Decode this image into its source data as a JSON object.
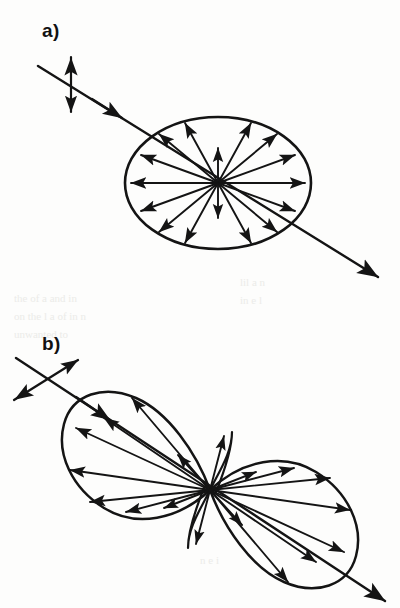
{
  "figure": {
    "background_color": "#fdfdfc",
    "ink_color": "#141414",
    "bleed_color": "#e9e9e6",
    "width": 400,
    "height": 608
  },
  "panels": [
    {
      "id": "a",
      "label": "a)",
      "label_pos": {
        "x": 42,
        "y": 37
      },
      "description": "Incident beam linearly polarized perpendicular to the scattering plane; scattered intensity pattern is circular (isotropic in plane).",
      "pattern_type": "circular",
      "beam": {
        "name": "incident-beam",
        "start": {
          "x": 38,
          "y": 66
        },
        "end": {
          "x": 378,
          "y": 277
        },
        "arrow_at": "end",
        "mid_arrow_at": {
          "x": 118,
          "y": 116
        }
      },
      "polarization_marker": {
        "name": "polarization-double-arrow-vertical",
        "style": "double-headed",
        "x1": 71,
        "y1": 54,
        "x2": 71,
        "y2": 115
      },
      "envelope": {
        "name": "scattering-envelope-ellipse",
        "cx": 218,
        "cy": 183,
        "rx": 93,
        "ry": 66
      },
      "center": {
        "x": 218,
        "y": 183
      },
      "radial_arrows_deg": [
        0,
        24,
        48,
        66,
        90,
        114,
        132,
        156,
        180,
        204,
        228,
        246,
        270,
        294,
        312,
        336
      ],
      "short_arrow_deg": [
        90,
        270
      ],
      "arrow_count": 16
    },
    {
      "id": "b",
      "label": "b)",
      "label_pos": {
        "x": 42,
        "y": 350
      },
      "description": "Incident beam linearly polarized in the scattering plane; scattered intensity follows a two-lobed dipole pattern with a null along the polarization direction.",
      "pattern_type": "dipole-two-lobe",
      "beam": {
        "name": "incident-beam",
        "start": {
          "x": 16,
          "y": 358
        },
        "end": {
          "x": 385,
          "y": 602
        },
        "arrow_at": "end",
        "mid_arrow_at": {
          "x": 105,
          "y": 417
        }
      },
      "polarization_marker": {
        "name": "polarization-double-arrow-crossed",
        "style": "double-headed",
        "x1": 12,
        "y1": 400,
        "x2": 78,
        "y2": 360
      },
      "center": {
        "x": 210,
        "y": 490
      },
      "lobe_axis_deg": 147,
      "lobes": [
        {
          "name": "upper-left-lobe",
          "direction_deg": 147,
          "radius": 120
        },
        {
          "name": "lower-right-lobe",
          "direction_deg": 327,
          "radius": 120
        }
      ],
      "radial_arrows_deg": [
        10,
        25,
        40,
        58,
        76,
        100,
        122,
        145,
        168,
        190,
        205,
        220,
        238,
        256,
        280,
        302,
        325,
        348
      ],
      "arrow_count": 18
    }
  ],
  "bleed_through_lines": [
    {
      "x": 14,
      "y": 302,
      "text": "the  of  a  and  in"
    },
    {
      "x": 14,
      "y": 320,
      "text": "on  the  l  a  of  in  n"
    },
    {
      "x": 14,
      "y": 338,
      "text": "unwanted  to"
    },
    {
      "x": 240,
      "y": 286,
      "text": "lil     a      n"
    },
    {
      "x": 240,
      "y": 304,
      "text": "in     e     l"
    },
    {
      "x": 200,
      "y": 564,
      "text": "n   e   i"
    }
  ]
}
